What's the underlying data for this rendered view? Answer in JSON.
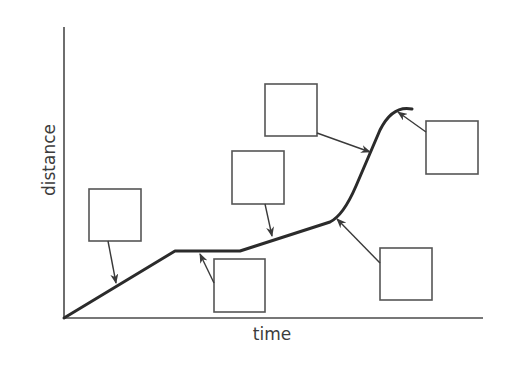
{
  "diagram": {
    "axes": {
      "x_label": "time",
      "y_label": "distance"
    },
    "curve_segments": [
      {
        "id": "constant-speed-1",
        "description": "straight rising line from origin"
      },
      {
        "id": "stationary",
        "description": "flat horizontal section"
      },
      {
        "id": "constant-speed-slow",
        "description": "gentle straight rise"
      },
      {
        "id": "accelerating",
        "description": "curve bending upward"
      },
      {
        "id": "constant-speed-fast",
        "description": "steep straight rise"
      },
      {
        "id": "decelerating",
        "description": "curve levelling off at the top"
      }
    ],
    "label_boxes": [
      {
        "id": "box-1",
        "text": "",
        "points_to": "constant-speed-1"
      },
      {
        "id": "box-2",
        "text": "",
        "points_to": "stationary"
      },
      {
        "id": "box-3",
        "text": "",
        "points_to": "constant-speed-slow"
      },
      {
        "id": "box-4",
        "text": "",
        "points_to": "constant-speed-fast"
      },
      {
        "id": "box-5",
        "text": "",
        "points_to": "accelerating"
      },
      {
        "id": "box-6",
        "text": "",
        "points_to": "decelerating"
      }
    ],
    "colors": {
      "curve": "#2b2b2b",
      "axis": "#4a4a4a",
      "box_stroke": "#555555",
      "text": "#3c3c3c",
      "background": "#ffffff"
    }
  }
}
